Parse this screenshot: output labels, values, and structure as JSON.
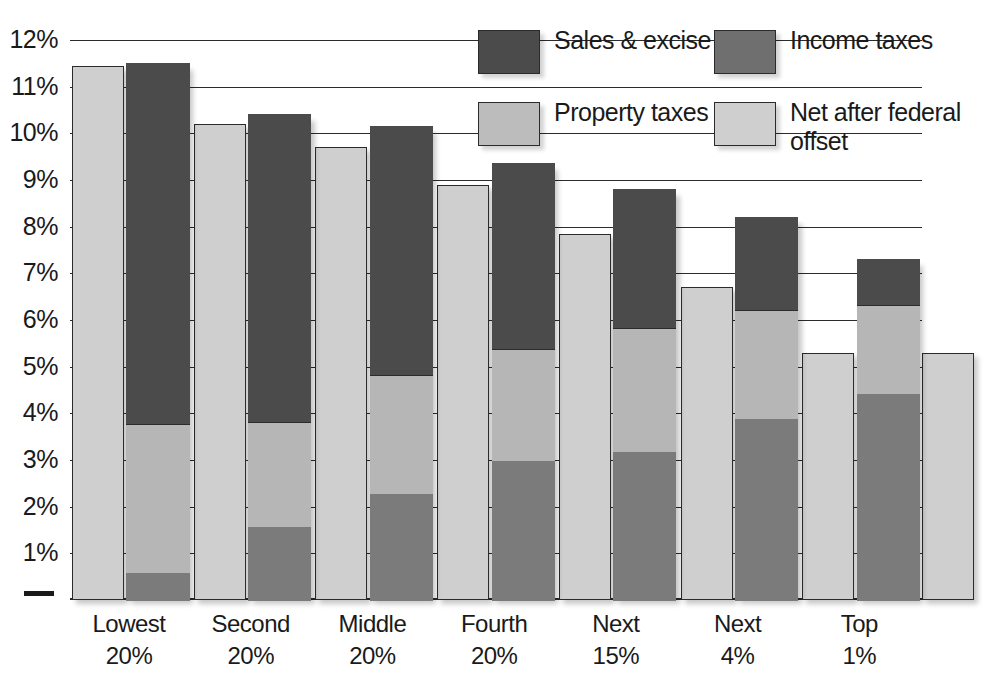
{
  "chart_data": {
    "type": "bar",
    "title": "",
    "subtitle": "",
    "xlabel": "",
    "ylabel": "",
    "ylim": [
      0,
      12
    ],
    "grid": true,
    "stacked": true,
    "legend_position": "top-right",
    "y_ticks": [
      "12%",
      "11%",
      "10%",
      "9%",
      "8%",
      "7%",
      "6%",
      "5%",
      "4%",
      "3%",
      "2%",
      "1%"
    ],
    "y_tick_values": [
      12,
      11,
      10,
      9,
      8,
      7,
      6,
      5,
      4,
      3,
      2,
      1
    ],
    "categories": [
      "Lowest 20%",
      "Second 20%",
      "Middle 20%",
      "Fourth 20%",
      "Next 15%",
      "Next 4%",
      "Top 1%"
    ],
    "category_lines": [
      [
        "Lowest",
        "20%"
      ],
      [
        "Second",
        "20%"
      ],
      [
        "Middle",
        "20%"
      ],
      [
        "Fourth",
        "20%"
      ],
      [
        "Next",
        "15%"
      ],
      [
        "Next",
        "4%"
      ],
      [
        "Top",
        "1%"
      ]
    ],
    "series": [
      {
        "name": "Sales & excise taxes",
        "color": "#4b4b4b",
        "values": [
          7.7,
          6.55,
          5.3,
          3.95,
          2.95,
          1.95,
          0.95
        ]
      },
      {
        "name": "Income taxes",
        "color": "#7b7b7b",
        "values": [
          0.55,
          1.55,
          2.25,
          2.95,
          3.15,
          3.85,
          4.4
        ]
      },
      {
        "name": "Property taxes",
        "color": "#b6b6b6",
        "values": [
          3.2,
          2.25,
          2.55,
          2.4,
          2.65,
          2.35,
          1.9
        ]
      },
      {
        "name": "Net after federal offset",
        "color": "#cfcfcf",
        "values": [
          11.45,
          10.2,
          9.7,
          8.9,
          7.85,
          6.7,
          5.3
        ]
      }
    ],
    "stack_totals": [
      11.45,
      10.35,
      10.1,
      9.3,
      8.75,
      8.15,
      7.25
    ],
    "stack_tops": {
      "income_top": [
        0.55,
        1.55,
        2.25,
        2.95,
        3.15,
        3.85,
        4.4
      ],
      "property_top": [
        3.75,
        3.8,
        4.8,
        5.35,
        5.8,
        6.2,
        6.3
      ],
      "sales_top": [
        11.45,
        10.35,
        10.1,
        9.3,
        8.75,
        8.15,
        7.25
      ]
    },
    "annotations": []
  },
  "legend": {
    "items": [
      {
        "label": "Sales & excise taxes",
        "swatch": "sales-swatch"
      },
      {
        "label": "Income taxes",
        "swatch": "income-swatch"
      },
      {
        "label": "Property taxes",
        "swatch": "property-swatch"
      },
      {
        "label": "Net after federal offset",
        "swatch": "net-swatch"
      }
    ]
  },
  "axis": {
    "zero_marker": "0%"
  }
}
